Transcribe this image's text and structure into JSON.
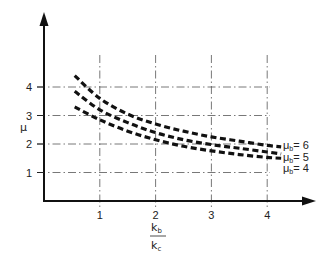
{
  "chart_data": {
    "type": "line",
    "title": "",
    "xlabel": "k_b / k_c",
    "ylabel": "μ",
    "xlim": [
      0,
      4.5
    ],
    "ylim": [
      0,
      5.5
    ],
    "x_ticks": [
      1,
      2,
      3,
      4
    ],
    "y_ticks": [
      1,
      2,
      3,
      4
    ],
    "grid": true,
    "grid_style": "dash-dot",
    "legend_position": "inline-right",
    "x": [
      0.55,
      1,
      1.5,
      2,
      2.5,
      3,
      3.5,
      4,
      4.25
    ],
    "series": [
      {
        "name": "μb = 6",
        "values": [
          4.4,
          3.6,
          3.05,
          2.7,
          2.45,
          2.25,
          2.1,
          1.95,
          1.9
        ]
      },
      {
        "name": "μb = 5",
        "values": [
          3.85,
          3.2,
          2.75,
          2.4,
          2.15,
          1.98,
          1.85,
          1.72,
          1.65
        ]
      },
      {
        "name": "μb = 4",
        "values": [
          3.3,
          2.85,
          2.45,
          2.15,
          1.92,
          1.76,
          1.63,
          1.53,
          1.5
        ]
      }
    ]
  },
  "labels": {
    "y_axis": "μ",
    "x_axis_numerator": "k",
    "x_axis_numerator_sub": "b",
    "x_axis_denominator": "k",
    "x_axis_denominator_sub": "c",
    "x_ticks": [
      "1",
      "2",
      "3",
      "4"
    ],
    "y_ticks": [
      "1",
      "2",
      "3",
      "4"
    ],
    "legend": [
      {
        "mu": "μ",
        "sub": "b",
        "value": "= 6"
      },
      {
        "mu": "μ",
        "sub": "b",
        "value": "= 5"
      },
      {
        "mu": "μ",
        "sub": "b",
        "value": "= 4"
      }
    ]
  }
}
